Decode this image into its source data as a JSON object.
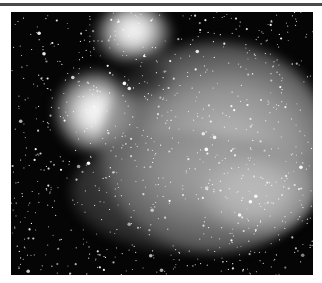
{
  "figure": {
    "colors": {
      "background": "#ffffff",
      "rule": "#4a4a4a",
      "sky": "#050505",
      "nebula": "#e8e8e8"
    }
  }
}
